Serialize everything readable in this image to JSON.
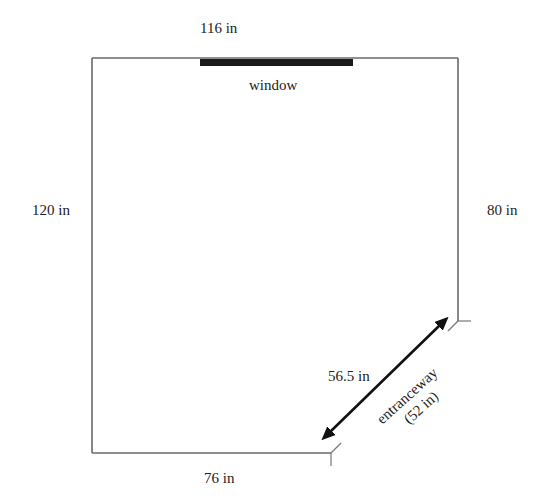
{
  "diagram": {
    "type": "floor-plan",
    "dimensions": {
      "top_wall": "116 in",
      "left_wall": "120 in",
      "right_wall": "80 in",
      "bottom_wall": "76 in",
      "diagonal_wall": "56.5 in"
    },
    "features": {
      "window_label": "window",
      "entrance_label": "entranceway",
      "entrance_width": "(52 in)"
    },
    "colors": {
      "wall": "#6a6a6a",
      "window": "#1a1a1a",
      "arrow": "#111111",
      "text": "#222222"
    }
  }
}
